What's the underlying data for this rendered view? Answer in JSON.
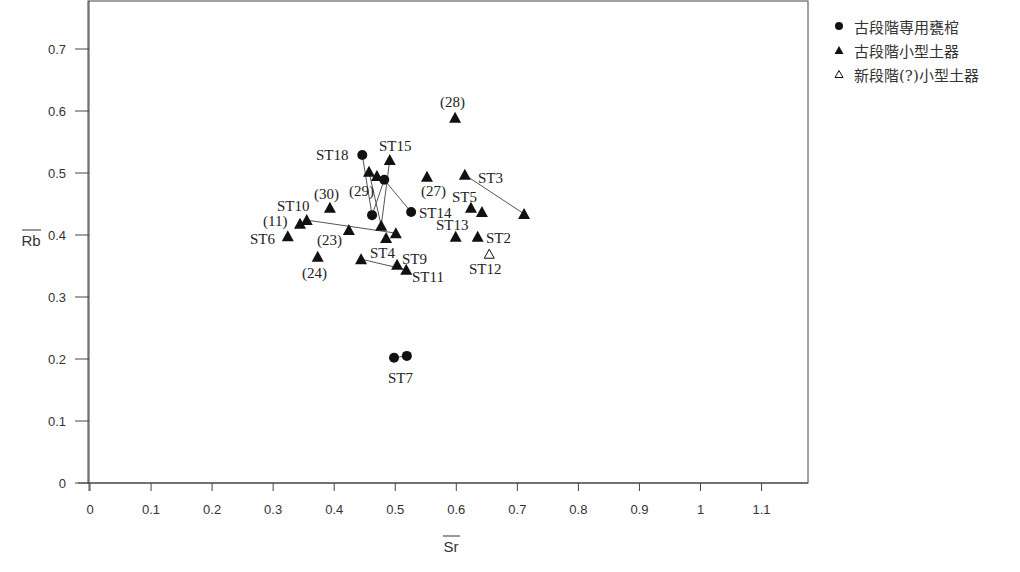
{
  "chart_data": {
    "type": "scatter",
    "title": "",
    "xlabel": "Sr",
    "ylabel": "Rb",
    "xlabel_overline": true,
    "ylabel_overline": true,
    "xlim": [
      0,
      1.17
    ],
    "ylim": [
      0,
      0.78
    ],
    "x_ticks": [
      0,
      0.1,
      0.2,
      0.3,
      0.4,
      0.5,
      0.6,
      0.7,
      0.8,
      0.9,
      1,
      1.1
    ],
    "x_tick_labels": [
      "0",
      "0.1",
      "0.2",
      "0.3",
      "0.4",
      "0.5",
      "0.6",
      "0.7",
      "0.8",
      "0.9",
      "1",
      "1.1"
    ],
    "y_ticks": [
      0,
      0.1,
      0.2,
      0.3,
      0.4,
      0.5,
      0.6,
      0.7
    ],
    "y_tick_labels": [
      "0",
      "0.1",
      "0.2",
      "0.3",
      "0.4",
      "0.5",
      "0.6",
      "0.7"
    ],
    "grid": false,
    "legend_position": "right-top",
    "series": [
      {
        "name": "古段階専用甕棺",
        "marker": "filled-circle",
        "points": [
          {
            "id": "c1",
            "x": 0.446,
            "y": 0.529,
            "label": "ST18"
          },
          {
            "id": "c2",
            "x": 0.482,
            "y": 0.489,
            "label": ""
          },
          {
            "id": "c3",
            "x": 0.462,
            "y": 0.432,
            "label": ""
          },
          {
            "id": "c4",
            "x": 0.526,
            "y": 0.437,
            "label": "ST14"
          },
          {
            "id": "c5",
            "x": 0.498,
            "y": 0.202,
            "label": ""
          },
          {
            "id": "c6",
            "x": 0.519,
            "y": 0.205,
            "label": "ST7"
          }
        ]
      },
      {
        "name": "古段階小型土器",
        "marker": "filled-triangle",
        "points": [
          {
            "id": "t1",
            "x": 0.491,
            "y": 0.521,
            "label": "ST15"
          },
          {
            "id": "t2",
            "x": 0.457,
            "y": 0.502,
            "label": ""
          },
          {
            "id": "t3",
            "x": 0.47,
            "y": 0.495,
            "label": "(29)"
          },
          {
            "id": "t4",
            "x": 0.477,
            "y": 0.415,
            "label": ""
          },
          {
            "id": "t5",
            "x": 0.501,
            "y": 0.403,
            "label": ""
          },
          {
            "id": "t6",
            "x": 0.485,
            "y": 0.395,
            "label": "ST4"
          },
          {
            "id": "t7",
            "x": 0.393,
            "y": 0.444,
            "label": "(30)"
          },
          {
            "id": "t8",
            "x": 0.355,
            "y": 0.424,
            "label": "ST10"
          },
          {
            "id": "t9",
            "x": 0.344,
            "y": 0.418,
            "label": "(11)"
          },
          {
            "id": "t10",
            "x": 0.324,
            "y": 0.398,
            "label": "ST6"
          },
          {
            "id": "t11",
            "x": 0.424,
            "y": 0.408,
            "label": "(23)"
          },
          {
            "id": "t12",
            "x": 0.373,
            "y": 0.365,
            "label": "(24)"
          },
          {
            "id": "t13",
            "x": 0.444,
            "y": 0.361,
            "label": ""
          },
          {
            "id": "t14",
            "x": 0.503,
            "y": 0.352,
            "label": "ST9"
          },
          {
            "id": "t15",
            "x": 0.518,
            "y": 0.344,
            "label": "ST11"
          },
          {
            "id": "t16",
            "x": 0.598,
            "y": 0.589,
            "label": "(28)"
          },
          {
            "id": "t17",
            "x": 0.552,
            "y": 0.494,
            "label": "(27)"
          },
          {
            "id": "t18",
            "x": 0.614,
            "y": 0.497,
            "label": "ST3"
          },
          {
            "id": "t19",
            "x": 0.711,
            "y": 0.434,
            "label": ""
          },
          {
            "id": "t20",
            "x": 0.624,
            "y": 0.444,
            "label": "ST5"
          },
          {
            "id": "t21",
            "x": 0.642,
            "y": 0.437,
            "label": ""
          },
          {
            "id": "t22",
            "x": 0.599,
            "y": 0.397,
            "label": "ST13"
          },
          {
            "id": "t23",
            "x": 0.635,
            "y": 0.397,
            "label": "ST2"
          }
        ]
      },
      {
        "name": "新段階(?)小型土器",
        "marker": "open-triangle",
        "points": [
          {
            "id": "o1",
            "x": 0.654,
            "y": 0.369,
            "label": "ST12"
          }
        ]
      }
    ],
    "connectors": [
      [
        "c1",
        "c3"
      ],
      [
        "c2",
        "c3"
      ],
      [
        "c2",
        "c4"
      ],
      [
        "t2",
        "t4"
      ],
      [
        "t1",
        "t4"
      ],
      [
        "t8",
        "t5"
      ],
      [
        "t13",
        "t15"
      ],
      [
        "t18",
        "t19"
      ],
      [
        "c5",
        "c6"
      ]
    ],
    "annotations": [
      {
        "text": "ST18",
        "x": 316,
        "y": 160
      },
      {
        "text": "ST15",
        "x": 379,
        "y": 151
      },
      {
        "text": "(29)",
        "x": 349,
        "y": 196
      },
      {
        "text": "(30)",
        "x": 314,
        "y": 199
      },
      {
        "text": "ST10",
        "x": 277,
        "y": 211
      },
      {
        "text": "(11)",
        "x": 263,
        "y": 226
      },
      {
        "text": "ST6",
        "x": 250,
        "y": 244
      },
      {
        "text": "(23)",
        "x": 317,
        "y": 245
      },
      {
        "text": "(24)",
        "x": 302,
        "y": 278
      },
      {
        "text": "ST4",
        "x": 370,
        "y": 258
      },
      {
        "text": "ST9",
        "x": 402,
        "y": 264
      },
      {
        "text": "ST11",
        "x": 412,
        "y": 282
      },
      {
        "text": "ST14",
        "x": 419,
        "y": 218
      },
      {
        "text": "(28)",
        "x": 440,
        "y": 107
      },
      {
        "text": "(27)",
        "x": 421,
        "y": 196
      },
      {
        "text": "ST3",
        "x": 478,
        "y": 183
      },
      {
        "text": "ST5",
        "x": 452,
        "y": 202
      },
      {
        "text": "ST13",
        "x": 436,
        "y": 230
      },
      {
        "text": "ST2",
        "x": 486,
        "y": 243
      },
      {
        "text": "ST12",
        "x": 469,
        "y": 274
      },
      {
        "text": "ST7",
        "x": 388,
        "y": 383
      }
    ]
  },
  "legend": {
    "items": [
      {
        "label": "古段階専用甕棺",
        "marker": "filled-circle"
      },
      {
        "label": "古段階小型土器",
        "marker": "filled-triangle"
      },
      {
        "label": "新段階(?)小型土器",
        "marker": "open-triangle"
      }
    ]
  }
}
